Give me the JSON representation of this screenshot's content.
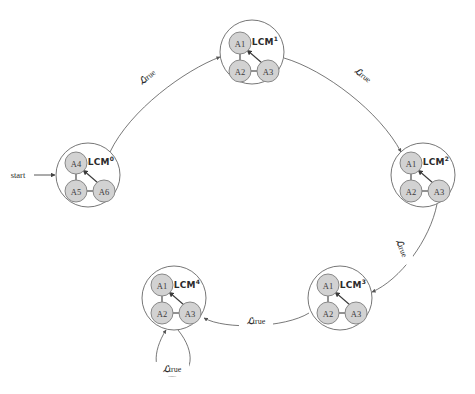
{
  "diagram": {
    "type": "state-transition-graph",
    "start_label": "start",
    "colors": {
      "atom_fill": "#d2d2d2",
      "atom_stroke": "#888888",
      "outer_stroke": "#666666",
      "edge_stroke": "#555555",
      "text": "#2b2b2b",
      "background": "#ffffff"
    },
    "states": [
      {
        "id": "lcm0",
        "name": "LCM",
        "superscript": "0",
        "cx": 88,
        "cy": 175,
        "r": 32,
        "label_x": 101,
        "label_y": 162,
        "atoms": [
          {
            "label": "A4",
            "cx": 76,
            "cy": 163,
            "r": 11
          },
          {
            "label": "A5",
            "cx": 76,
            "cy": 191,
            "r": 11
          },
          {
            "label": "A6",
            "cx": 104,
            "cy": 191,
            "r": 11
          }
        ]
      },
      {
        "id": "lcm1",
        "name": "LCM",
        "superscript": "1",
        "cx": 252,
        "cy": 52,
        "r": 32,
        "label_x": 265,
        "label_y": 42,
        "atoms": [
          {
            "label": "A1",
            "cx": 240,
            "cy": 43,
            "r": 11
          },
          {
            "label": "A2",
            "cx": 240,
            "cy": 71,
            "r": 11
          },
          {
            "label": "A3",
            "cx": 268,
            "cy": 71,
            "r": 11
          }
        ]
      },
      {
        "id": "lcm2",
        "name": "LCM",
        "superscript": "2",
        "cx": 423,
        "cy": 175,
        "r": 32,
        "label_x": 436,
        "label_y": 162,
        "atoms": [
          {
            "label": "A1",
            "cx": 411,
            "cy": 163,
            "r": 11
          },
          {
            "label": "A2",
            "cx": 411,
            "cy": 191,
            "r": 11
          },
          {
            "label": "A3",
            "cx": 439,
            "cy": 191,
            "r": 11
          }
        ]
      },
      {
        "id": "lcm3",
        "name": "LCM",
        "superscript": "3",
        "cx": 340,
        "cy": 298,
        "r": 32,
        "label_x": 353,
        "label_y": 285,
        "atoms": [
          {
            "label": "A1",
            "cx": 328,
            "cy": 285,
            "r": 11
          },
          {
            "label": "A2",
            "cx": 328,
            "cy": 313,
            "r": 11
          },
          {
            "label": "A3",
            "cx": 356,
            "cy": 313,
            "r": 11
          }
        ]
      },
      {
        "id": "lcm4",
        "name": "LCM",
        "superscript": "4",
        "cx": 174,
        "cy": 298,
        "r": 32,
        "label_x": 187,
        "label_y": 285,
        "atoms": [
          {
            "label": "A1",
            "cx": 162,
            "cy": 285,
            "r": 11
          },
          {
            "label": "A2",
            "cx": 162,
            "cy": 313,
            "r": 11
          },
          {
            "label": "A3",
            "cx": 190,
            "cy": 313,
            "r": 11
          }
        ]
      }
    ],
    "transitions": [
      {
        "id": "t0",
        "from": "lcm0",
        "to": "lcm1",
        "label_script": "ℒ",
        "label_text": "true",
        "label_x": 147,
        "label_y": 77,
        "label_rotate": -38
      },
      {
        "id": "t1",
        "from": "lcm1",
        "to": "lcm2",
        "label_script": "ℒ",
        "label_text": "true",
        "label_x": 363,
        "label_y": 75,
        "label_rotate": 38
      },
      {
        "id": "t2",
        "from": "lcm2",
        "to": "lcm3",
        "label_script": "ℒ",
        "label_text": "true",
        "label_x": 402,
        "label_y": 248,
        "label_rotate": 68
      },
      {
        "id": "t3",
        "from": "lcm3",
        "to": "lcm4",
        "label_script": "ℒ",
        "label_text": "true",
        "label_x": 256,
        "label_y": 321,
        "label_rotate": 0
      },
      {
        "id": "t4",
        "from": "lcm4",
        "to": "lcm4",
        "self_loop": true,
        "label_script": "ℒ",
        "label_text": "true",
        "label_x": 172,
        "label_y": 369,
        "label_rotate": 0
      }
    ]
  }
}
